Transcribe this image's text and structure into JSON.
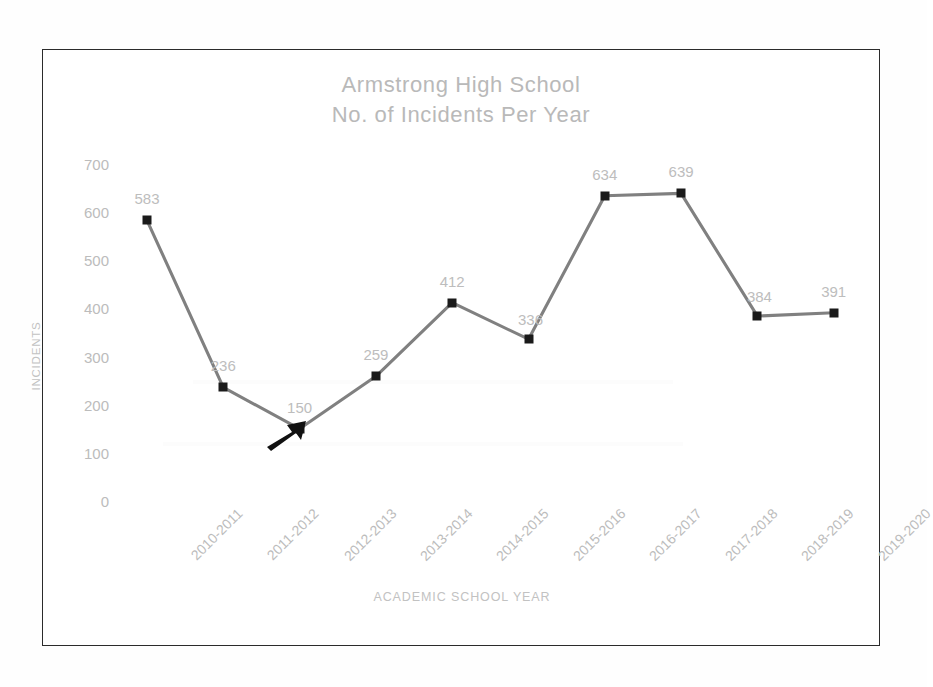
{
  "chart_data": {
    "type": "line",
    "title": "Armstrong High School\nNo. of Incidents Per Year",
    "title_line1": "Armstrong High School",
    "title_line2": "No. of Incidents Per Year",
    "xlabel": "ACADEMIC SCHOOL YEAR",
    "ylabel": "INCIDENTS",
    "categories": [
      "2010-2011",
      "2011-2012",
      "2012-2013",
      "2013-2014",
      "2014-2015",
      "2015-2016",
      "2016-2017",
      "2017-2018",
      "2018-2019",
      "2019-2020"
    ],
    "values": [
      583,
      236,
      150,
      259,
      412,
      336,
      634,
      639,
      384,
      391
    ],
    "data_labels": [
      "583",
      "236",
      "150",
      "259",
      "412",
      "336",
      "634",
      "639",
      "384",
      "391"
    ],
    "ylim": [
      0,
      700
    ],
    "y_ticks": [
      700,
      600,
      500,
      400,
      300,
      200,
      100,
      0
    ],
    "y_tick_labels": [
      "700",
      "600",
      "500",
      "400",
      "300",
      "200",
      "100",
      "0"
    ],
    "grid": false,
    "legend": false,
    "legend_position": "none",
    "series": [
      {
        "name": "Incidents",
        "values": [
          583,
          236,
          150,
          259,
          412,
          336,
          634,
          639,
          384,
          391
        ]
      }
    ],
    "annotations": [
      {
        "type": "arrow",
        "points_to_category": "2012-2013",
        "points_to_value": 150,
        "color": "#111111",
        "direction": "up-right"
      }
    ],
    "colors": {
      "line": "#808080",
      "marker": "#1a1a1a",
      "data_label_text": "#bdbdbd",
      "axis_text": "#bcbcbc",
      "title_text": "#b9b9b9",
      "frame_border": "#2b2b2b",
      "background": "#ffffff"
    }
  }
}
